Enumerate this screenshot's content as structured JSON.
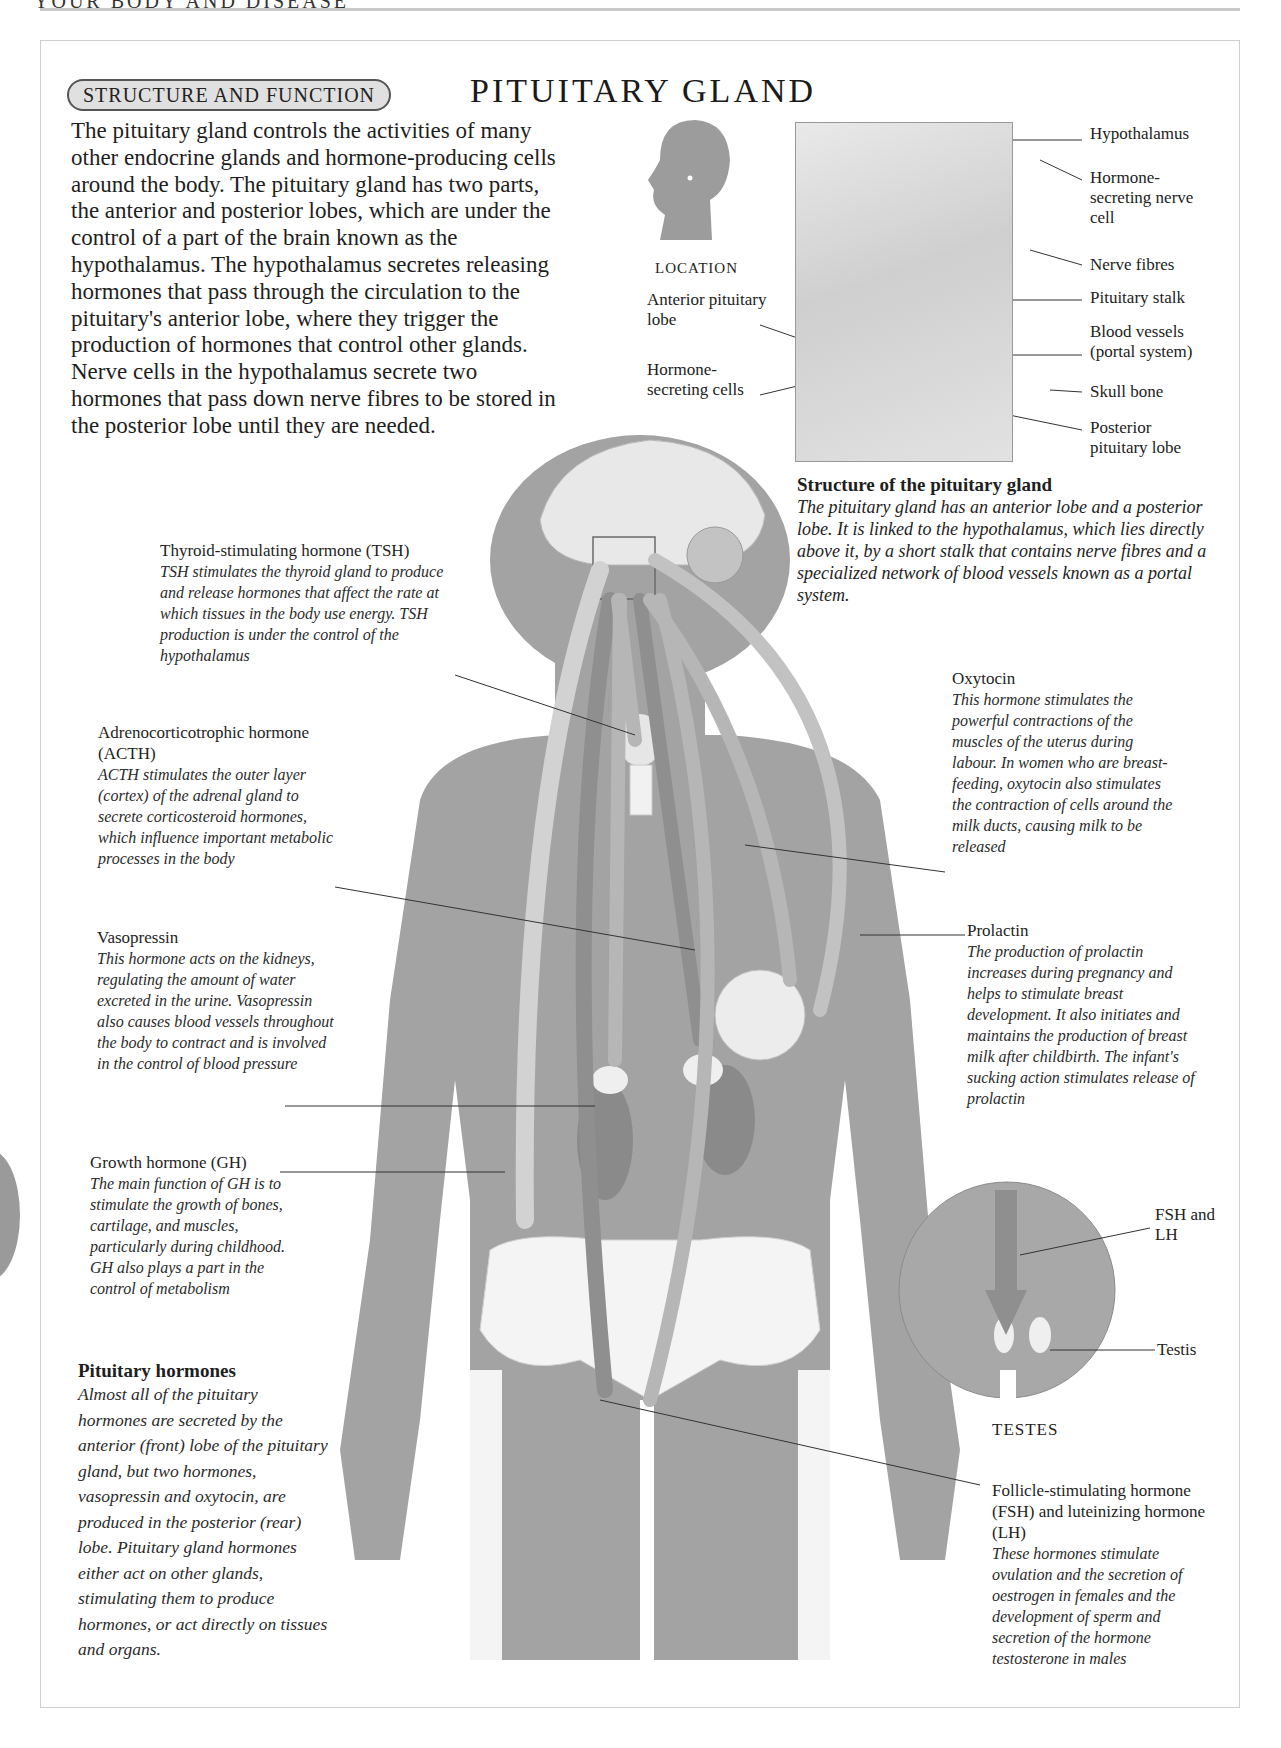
{
  "page": {
    "running_head": "YOUR BODY AND DISEASE",
    "section_tag": "STRUCTURE AND FUNCTION",
    "title": "PITUITARY GLAND"
  },
  "intro": "The pituitary gland controls the activities of many other endocrine glands and hormone-producing cells around the body. The pituitary gland has two parts, the anterior and posterior lobes, which are under the control of a part of the brain known as the hypothalamus. The hypothalamus secretes releasing hormones that pass through the circulation to the pituitary's anterior lobe, where they trigger the production of hormones that control other glands. Nerve cells in the hypothalamus secrete two hormones that pass down nerve fibres to be stored in the posterior lobe until they are needed.",
  "location": {
    "title": "LOCATION",
    "labels": {
      "anterior": "Anterior pituitary lobe",
      "secreting_cells": "Hormone-secreting cells"
    }
  },
  "structure_diagram": {
    "labels": [
      "Hypothalamus",
      "Hormone-secreting nerve cell",
      "Nerve fibres",
      "Pituitary stalk",
      "Blood vessels (portal system)",
      "Skull bone",
      "Posterior pituitary lobe"
    ],
    "caption_title": "Structure of the pituitary gland",
    "caption_body": "The pituitary gland has an anterior lobe and a posterior lobe. It is linked to the hypothalamus, which lies directly above it, by a short stalk that contains nerve fibres and a specialized network of blood vessels known as a portal system."
  },
  "hormones": {
    "tsh": {
      "title": "Thyroid-stimulating hormone (TSH)",
      "body": "TSH stimulates the thyroid gland to produce and release hormones that affect the rate at which tissues in the body use energy. TSH production is under the control of the hypothalamus"
    },
    "acth": {
      "title": "Adrenocorticotrophic hormone (ACTH)",
      "body": "ACTH stimulates the outer layer (cortex) of the adrenal gland to secrete corticosteroid hormones, which influence important metabolic processes in the body"
    },
    "vasopressin": {
      "title": "Vasopressin",
      "body": "This hormone acts on the kidneys, regulating the amount of water excreted in the urine. Vasopressin also causes blood vessels throughout the body to contract and is involved in the control of blood pressure"
    },
    "gh": {
      "title": "Growth hormone (GH)",
      "body": "The main function of GH is to stimulate the growth of bones, cartilage, and muscles, particularly during childhood. GH also plays a part in the control of metabolism"
    },
    "oxytocin": {
      "title": "Oxytocin",
      "body": "This hormone stimulates the powerful contractions of the muscles of the uterus during labour. In women who are breast-feeding, oxytocin also stimulates the contraction of cells around the milk ducts, causing milk to be released"
    },
    "prolactin": {
      "title": "Prolactin",
      "body": "The production of prolactin increases during pregnancy and helps to stimulate breast development. It also initiates and maintains the production of breast milk after childbirth. The infant's sucking action stimulates release of prolactin"
    },
    "fsh_lh": {
      "title": "Follicle-stimulating hormone (FSH) and luteinizing hormone (LH)",
      "body": "These hormones stimulate ovulation and the secretion of oestrogen in females and the development of sperm and secretion of the hormone testosterone in males"
    }
  },
  "testes_inset": {
    "title": "TESTES",
    "label_hormone": "FSH and LH",
    "label_testis": "Testis"
  },
  "summary": {
    "title": "Pituitary hormones",
    "body": "Almost all of the pituitary hormones are secreted by the anterior (front) lobe of the pituitary gland, but two hormones, vasopressin and oxytocin, are produced in the posterior (rear) lobe. Pituitary gland hormones either act on other glands, stimulating them to produce hormones, or act directly on tissues and organs."
  },
  "colors": {
    "body": "#a3a3a3",
    "organ_dark": "#8a8a8a",
    "bone": "#f3f3f3",
    "arrow_light": "#d2d2d2",
    "arrow_mid": "#b6b6b6",
    "arrow_dark": "#8f8f8f"
  }
}
